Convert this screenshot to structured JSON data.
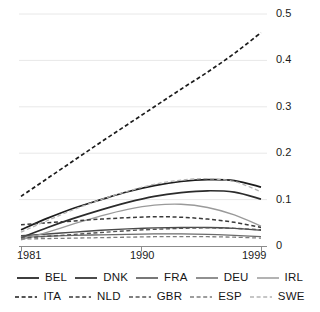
{
  "chart_data": {
    "type": "line",
    "title": "",
    "subtitle": "",
    "xlabel": "",
    "ylabel": "",
    "xlim": [
      1981,
      1999
    ],
    "ylim": [
      0,
      0.5
    ],
    "grid": true,
    "grid_axis": "y",
    "legend_position": "bottom",
    "legend_columns": 5,
    "x_ticks": [
      1981,
      1990,
      1999
    ],
    "x_tick_labels": [
      "1981",
      "1990",
      "1999"
    ],
    "y_ticks": [
      0,
      0.1,
      0.2,
      0.3,
      0.4,
      0.5
    ],
    "y_tick_labels": [
      "0",
      "0.1",
      "0.2",
      "0.3",
      "0.4",
      "0.5"
    ],
    "x": [
      1981,
      1983,
      1985,
      1987,
      1989,
      1991,
      1993,
      1995,
      1997,
      1999
    ],
    "series": [
      {
        "name": "BEL",
        "style": "solid",
        "color": "#1c1c1c",
        "width": 1.7,
        "values": [
          0.035,
          0.06,
          0.082,
          0.1,
          0.117,
          0.13,
          0.139,
          0.143,
          0.141,
          0.127
        ]
      },
      {
        "name": "DNK",
        "style": "solid",
        "color": "#2b2b2b",
        "width": 1.7,
        "values": [
          0.018,
          0.04,
          0.06,
          0.078,
          0.094,
          0.107,
          0.115,
          0.119,
          0.116,
          0.101
        ]
      },
      {
        "name": "FRA",
        "style": "solid",
        "color": "#4a4a4a",
        "width": 1.4,
        "values": [
          0.022,
          0.026,
          0.03,
          0.034,
          0.037,
          0.039,
          0.04,
          0.04,
          0.038,
          0.034
        ]
      },
      {
        "name": "DEU",
        "style": "solid",
        "color": "#6b6b6b",
        "width": 1.3,
        "values": [
          0.019,
          0.021,
          0.023,
          0.024,
          0.025,
          0.026,
          0.026,
          0.025,
          0.023,
          0.02
        ]
      },
      {
        "name": "IRL",
        "style": "solid",
        "color": "#9a9a9a",
        "width": 1.3,
        "values": [
          0.013,
          0.03,
          0.048,
          0.065,
          0.079,
          0.088,
          0.09,
          0.083,
          0.067,
          0.043
        ]
      },
      {
        "name": "ITA",
        "style": "dashed",
        "color": "#1c1c1c",
        "width": 1.7,
        "values": [
          0.107,
          0.146,
          0.185,
          0.224,
          0.262,
          0.3,
          0.338,
          0.375,
          0.415,
          0.46
        ]
      },
      {
        "name": "NLD",
        "style": "dashed",
        "color": "#3a3a3a",
        "width": 1.5,
        "values": [
          0.046,
          0.05,
          0.054,
          0.058,
          0.061,
          0.063,
          0.062,
          0.058,
          0.051,
          0.04
        ]
      },
      {
        "name": "GBR",
        "style": "dashed",
        "color": "#555555",
        "width": 1.4,
        "values": [
          0.017,
          0.021,
          0.025,
          0.029,
          0.033,
          0.036,
          0.038,
          0.039,
          0.038,
          0.035
        ]
      },
      {
        "name": "ESP",
        "style": "dashed",
        "color": "#7d7d7d",
        "width": 1.3,
        "values": [
          0.015,
          0.016,
          0.017,
          0.018,
          0.019,
          0.02,
          0.02,
          0.02,
          0.019,
          0.017
        ]
      },
      {
        "name": "SWE",
        "style": "dashed",
        "color": "#b4b4b4",
        "width": 1.3,
        "values": [
          0.03,
          0.055,
          0.079,
          0.1,
          0.118,
          0.133,
          0.142,
          0.145,
          0.139,
          0.117
        ]
      }
    ],
    "legend_rows": [
      [
        "BEL",
        "DNK",
        "FRA",
        "DEU",
        "IRL"
      ],
      [
        "ITA",
        "NLD",
        "GBR",
        "ESP",
        "SWE"
      ]
    ],
    "colors": {
      "axis": "#8c8c8c",
      "grid": "#e8e8e8",
      "text": "#1a1a1a",
      "background": "#ffffff"
    }
  }
}
